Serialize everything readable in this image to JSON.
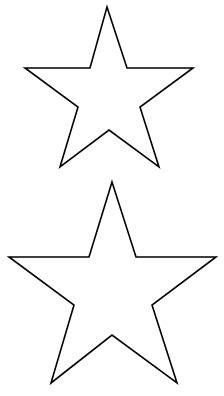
{
  "background": "#ffffff",
  "stroke_color": "#000000",
  "shapes": [
    {
      "name": "star-outline-top",
      "points": "107,7 127,68 193,68 140,107 159,167 109,130 60,167 78,107 25,68 90,68"
    },
    {
      "name": "star-outline-bottom",
      "points": "112,182 136,257 216,257 152,305 177,383 112,335 51,383 74,305 9,257 89,257"
    }
  ]
}
